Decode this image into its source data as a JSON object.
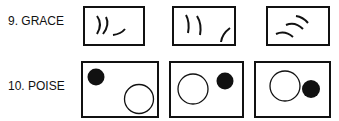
{
  "items": [
    {
      "label": "9. GRACE",
      "panels": [
        {
          "description": "two curved strokes and a small curve"
        },
        {
          "description": "two curved strokes and an arc in corner"
        },
        {
          "description": "three parallel arcs"
        }
      ]
    },
    {
      "label": "10. POISE",
      "panels": [
        {
          "description": "filled circle top-left, open circle bottom-right"
        },
        {
          "description": "open circle left, filled circle top-right"
        },
        {
          "description": "open circle center, filled circle right"
        }
      ]
    }
  ],
  "colors": {
    "ink": "#111111",
    "background": "#ffffff"
  }
}
